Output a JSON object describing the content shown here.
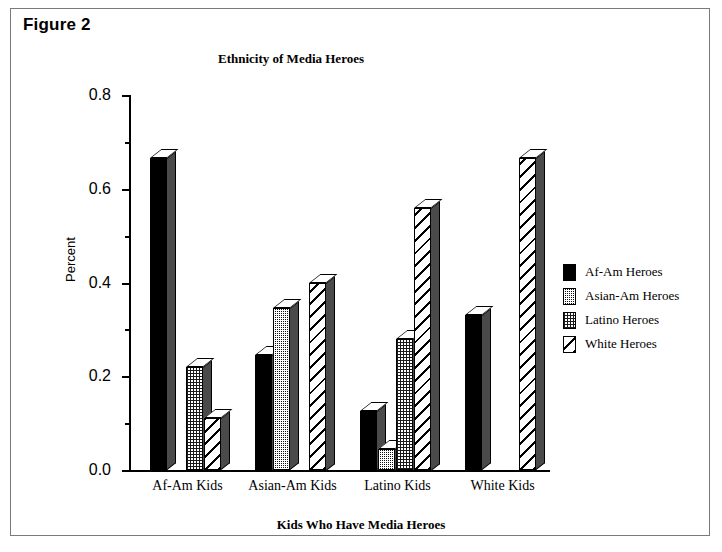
{
  "figure": {
    "label": "Figure 2"
  },
  "chart_data": {
    "type": "bar",
    "title": "Ethnicity of Media Heroes",
    "xlabel": "Kids Who Have Media Heroes",
    "ylabel": "Percent",
    "categories": [
      "Af-Am Kids",
      "Asian-Am Kids",
      "Latino Kids",
      "White Kids"
    ],
    "series": [
      {
        "name": "Af-Am Heroes",
        "values": [
          0.665,
          0.245,
          0.125,
          0.33
        ]
      },
      {
        "name": "Asian-Am Heroes",
        "values": [
          0.0,
          0.345,
          0.045,
          0.0
        ]
      },
      {
        "name": "Latino Heroes",
        "values": [
          0.22,
          0.0,
          0.28,
          0.0
        ]
      },
      {
        "name": "White Heroes",
        "values": [
          0.11,
          0.4,
          0.56,
          0.665
        ]
      }
    ],
    "ylim": [
      0.0,
      0.8
    ],
    "yticks": [
      "0.0",
      "0.2",
      "0.4",
      "0.6",
      "0.8"
    ],
    "ytick_values": [
      0.0,
      0.2,
      0.4,
      0.6,
      0.8
    ],
    "yminor_values": [
      0.1,
      0.3,
      0.5,
      0.7
    ],
    "grid": false,
    "legend_position": "right"
  },
  "legend": {
    "items": [
      {
        "label": "Af-Am Heroes",
        "pattern": "solid"
      },
      {
        "label": "Asian-Am Heroes",
        "pattern": "dark-stipple"
      },
      {
        "label": "Latino Heroes",
        "pattern": "light-stipple"
      },
      {
        "label": "White Heroes",
        "pattern": "diagonal-hatch"
      }
    ]
  }
}
